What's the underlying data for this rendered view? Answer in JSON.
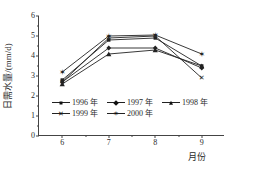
{
  "chart_data": {
    "type": "line",
    "title": "",
    "xlabel": "月份",
    "ylabel": "日需水量/(mm/d)",
    "x": [
      6,
      7,
      8,
      9
    ],
    "xtick_labels": [
      "6",
      "7",
      "8",
      "9"
    ],
    "ytick_labels": [
      "0",
      "1",
      "2",
      "3",
      "4",
      "5",
      "6"
    ],
    "ylim": [
      0,
      6
    ],
    "xlim": [
      5.5,
      9.5
    ],
    "grid": false,
    "legend_position": "inside-lower-left",
    "series": [
      {
        "name": "1996 年",
        "marker": "filled-square",
        "glyph": "",
        "values": [
          2.8,
          4.8,
          4.9,
          3.5
        ]
      },
      {
        "name": "1997 年",
        "marker": "filled-diamond",
        "glyph": "",
        "values": [
          2.7,
          4.4,
          4.4,
          3.4
        ]
      },
      {
        "name": "1998 年",
        "marker": "triangle",
        "glyph": "",
        "values": [
          2.6,
          4.1,
          4.3,
          3.5
        ]
      },
      {
        "name": "1999 年",
        "marker": "x",
        "glyph": "✕",
        "values": [
          2.7,
          4.9,
          5.0,
          2.9
        ]
      },
      {
        "name": "2000 年",
        "marker": "star",
        "glyph": "✶",
        "values": [
          3.2,
          5.0,
          5.05,
          4.1
        ]
      }
    ]
  },
  "colors": {
    "line": "#222222",
    "axis": "#444444",
    "background": "#ffffff"
  }
}
